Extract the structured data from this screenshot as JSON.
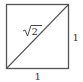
{
  "diagram": {
    "shape": "square",
    "diagonal_label_radicand": "2",
    "side_right_label": "1",
    "side_bottom_label": "1",
    "colors": {
      "stroke": "#555555",
      "text": "#333333"
    }
  }
}
